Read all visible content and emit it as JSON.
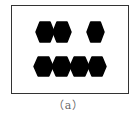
{
  "figure": {
    "caption": "（a）",
    "frame_color": "#333333",
    "shape_color": "#000000",
    "rows": [
      {
        "name": "top-row",
        "shapes": [
          {
            "x": 36,
            "y": 22,
            "w": 18,
            "h": 20
          },
          {
            "x": 53,
            "y": 22,
            "w": 18,
            "h": 20
          },
          {
            "x": 87,
            "y": 22,
            "w": 17,
            "h": 20
          }
        ]
      },
      {
        "name": "bottom-row",
        "shapes": [
          {
            "x": 34,
            "y": 57,
            "w": 19,
            "h": 19
          },
          {
            "x": 52,
            "y": 57,
            "w": 19,
            "h": 19
          },
          {
            "x": 70,
            "y": 57,
            "w": 19,
            "h": 19
          },
          {
            "x": 88,
            "y": 57,
            "w": 18,
            "h": 19
          }
        ]
      }
    ]
  }
}
